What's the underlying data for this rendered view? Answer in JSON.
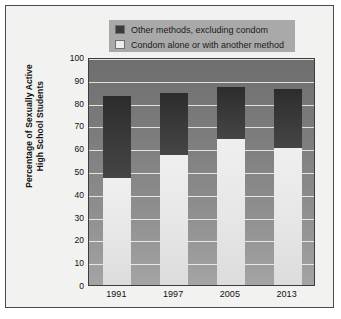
{
  "chart_data": {
    "type": "bar",
    "stacked": true,
    "title": "",
    "xlabel": "",
    "ylabel": "Percentage of Sexually Active High School Students",
    "categories": [
      "1991",
      "1997",
      "2005",
      "2013"
    ],
    "ylim": [
      0,
      100
    ],
    "yticks": [
      0,
      10,
      20,
      30,
      40,
      50,
      60,
      70,
      80,
      90,
      100
    ],
    "grid": true,
    "legend_position": "top-center",
    "series": [
      {
        "name": "Condom alone or with another method",
        "color": "#ececec",
        "values": [
          47,
          57,
          64,
          60
        ]
      },
      {
        "name": "Other methods, excluding condom",
        "color": "#3b3b3b",
        "values": [
          36,
          27,
          23,
          26
        ]
      }
    ],
    "totals": [
      83,
      84,
      87,
      86
    ]
  },
  "ytitle_lines": [
    "Percentage of Sexually Active",
    "High School Students"
  ],
  "legend": {
    "items": [
      {
        "label": "Other methods, excluding condom",
        "swatch": "dark"
      },
      {
        "label": "Condom alone or with another method",
        "swatch": "light"
      }
    ]
  }
}
